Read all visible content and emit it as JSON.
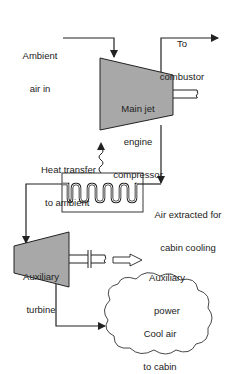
{
  "colors": {
    "component_fill": "#a8a8a8",
    "stroke": "#222222",
    "background": "#ffffff"
  },
  "components": {
    "compressor": {
      "label_line1": "Main jet",
      "label_line2": "engine",
      "label_line3": "compressor"
    },
    "turbine": {
      "label_line1": "Auxiliary",
      "label_line2": "turbine"
    },
    "heat_exchanger": {
      "label": ""
    },
    "cabin": {
      "label_line1": "Cool air",
      "label_line2": "to cabin"
    }
  },
  "labels": {
    "ambient_line1": "Ambient",
    "ambient_line2": "air in",
    "combustor_line1": "To",
    "combustor_line2": "combustor",
    "heat_line1": "Heat transfer",
    "heat_line2": "to ambient",
    "extracted_line1": "Air extracted for",
    "extracted_line2": "cabin cooling",
    "power_line1": "Auxiliary",
    "power_line2": "power"
  }
}
